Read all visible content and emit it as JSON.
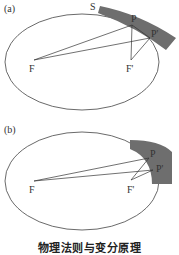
{
  "figures": [
    {
      "panel_label": "(a)",
      "surface_label": "S",
      "foci": [
        "F",
        "F'"
      ],
      "points": [
        "P",
        "P'"
      ],
      "band_color": "#6e6e6e"
    },
    {
      "panel_label": "(b)",
      "foci": [
        "F",
        "F'"
      ],
      "points": [
        "P",
        "P'"
      ],
      "band_color": "#6e6e6e"
    }
  ],
  "caption": "物理法则与变分原理"
}
